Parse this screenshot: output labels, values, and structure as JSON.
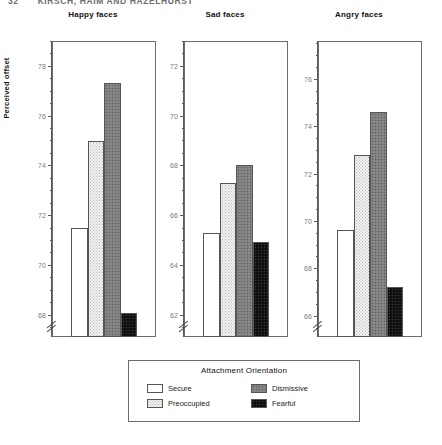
{
  "running_head": {
    "page_number": "32",
    "authors": "KIRSCH, HAIM AND HAZELHURST"
  },
  "figure": {
    "ylabel": "Perceived offset",
    "legend": {
      "title": "Attachment Orientation",
      "entries": [
        {
          "label": "Secure",
          "fill": "secure",
          "color": "#ffffff"
        },
        {
          "label": "Dismissive",
          "fill": "dismissive",
          "color": "#808080"
        },
        {
          "label": "Preoccupied",
          "fill": "preoccupied",
          "color": "#f2f2f2"
        },
        {
          "label": "Fearful",
          "fill": "fearful",
          "color": "#141414"
        }
      ]
    }
  },
  "chart_data": {
    "type": "bar",
    "title": "",
    "xlabel": "",
    "ylabel": "Perceived offset",
    "grid": false,
    "legend_position": "bottom-center",
    "legend_title": "Attachment Orientation",
    "categories": [
      "Secure",
      "Preoccupied",
      "Dismissive",
      "Fearful"
    ],
    "axis_break": true,
    "panels": [
      {
        "name": "Happy faces",
        "title": "Happy faces",
        "ylim": [
          67.1,
          79.0
        ],
        "yticks": [
          68,
          70,
          72,
          74,
          76,
          78
        ],
        "ytick_labels": [
          "68",
          "70",
          "72",
          "74",
          "76",
          "78"
        ],
        "minor_tick_step": 0.5,
        "values": [
          71.5,
          75.0,
          77.3,
          68.05
        ]
      },
      {
        "name": "Sad faces",
        "title": "Sad faces",
        "ylim": [
          61.1,
          73.0
        ],
        "yticks": [
          62,
          64,
          66,
          68,
          70,
          72
        ],
        "ytick_labels": [
          "62",
          "64",
          "66",
          "68",
          "70",
          "72"
        ],
        "minor_tick_step": 0.5,
        "values": [
          65.3,
          67.3,
          68.0,
          64.9
        ]
      },
      {
        "name": "Angry faces",
        "title": "Angry faces",
        "ylim": [
          65.1,
          77.6
        ],
        "yticks": [
          66,
          68,
          70,
          72,
          74,
          76
        ],
        "ytick_labels": [
          "66",
          "68",
          "70",
          "72",
          "74",
          "76"
        ],
        "minor_tick_step": 0.5,
        "values": [
          69.6,
          72.8,
          74.6,
          67.2
        ]
      }
    ]
  }
}
